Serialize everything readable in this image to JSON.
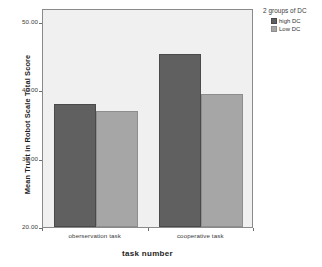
{
  "chart_data": {
    "type": "bar",
    "title": "",
    "xlabel": "task number",
    "ylabel": "Mean Trust in Robot Scale Total Score",
    "categories": [
      "oberservation task",
      "cooperative task"
    ],
    "series": [
      {
        "name": "high DC",
        "color": "#606060",
        "values": [
          38.0,
          45.3
        ]
      },
      {
        "name": "Low DC",
        "color": "#a6a6a6",
        "values": [
          36.9,
          39.4
        ]
      }
    ],
    "ylim": [
      20,
      52
    ],
    "yticks": [
      20,
      30,
      40,
      50
    ],
    "ytick_labels": [
      "20.00",
      "30.00",
      "40.00",
      "50.00"
    ],
    "grid": false,
    "legend": {
      "title": "2 groups of DC",
      "position": "right-top"
    }
  },
  "axes": {
    "y_title": "Mean Trust in Robot Scale Total Score",
    "x_title": "task number"
  },
  "legend": {
    "title": "2 groups of DC",
    "items": [
      {
        "label": "high DC",
        "color": "#606060"
      },
      {
        "label": "Low DC",
        "color": "#a6a6a6"
      }
    ]
  }
}
